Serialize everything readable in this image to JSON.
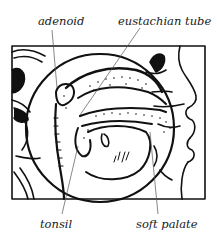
{
  "figure": {
    "labels": {
      "adenoid": "adenoid",
      "eustachian_tube": "eustachian tube",
      "tonsil": "tonsil",
      "soft_palate": "soft palate"
    },
    "colors": {
      "ink": "#111111",
      "background": "#ffffff",
      "leader": "#555555"
    }
  }
}
